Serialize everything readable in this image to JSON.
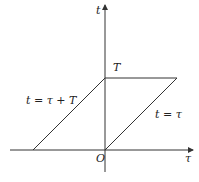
{
  "diagram": {
    "type": "integration-region",
    "axes": {
      "horizontal_label": "τ",
      "vertical_label": "t",
      "origin_label": "O"
    },
    "tick_labels": {
      "t_axis_value": "T"
    },
    "lines": [
      {
        "label": "t = τ + T",
        "description": "left boundary, from (-T,0) to (0,T)"
      },
      {
        "label": "t = τ",
        "description": "right boundary, from (0,0) to (T,T)"
      },
      {
        "label": "",
        "description": "top boundary t = T from (0,T) to (T,T)"
      }
    ],
    "colors": {
      "stroke": "#333333",
      "text": "#222222",
      "background": "#ffffff"
    }
  }
}
